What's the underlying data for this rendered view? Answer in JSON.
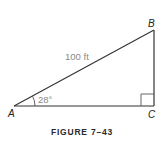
{
  "figure": {
    "caption": "FIGURE 7–43",
    "vertices": {
      "A": {
        "label": "A"
      },
      "B": {
        "label": "B"
      },
      "C": {
        "label": "C"
      }
    },
    "hypotenuse_label": "100 ft",
    "angle_label": "28°",
    "right_angle_at": "C",
    "colors": {
      "line": "#333333",
      "measure_text": "#8a8a8a",
      "vertex_text": "#222222"
    }
  }
}
